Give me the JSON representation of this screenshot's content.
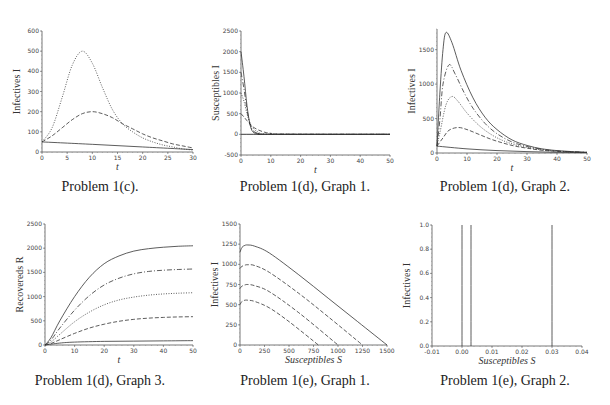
{
  "captions": [
    "Problem 1(c).",
    "Problem 1(d), Graph 1.",
    "Problem 1(d), Graph 2.",
    "Problem 1(d), Graph 3.",
    "Problem 1(e), Graph 1.",
    "Problem 1(e), Graph 2."
  ],
  "chart_data": [
    {
      "type": "line",
      "title": "Problem 1(c).",
      "xlabel": "t",
      "ylabel": "Infectives I",
      "xlim": [
        0,
        30
      ],
      "ylim": [
        0,
        600
      ],
      "xticks": [
        0,
        5,
        10,
        15,
        20,
        25,
        30
      ],
      "yticks": [
        0,
        100,
        200,
        300,
        400,
        500,
        600
      ],
      "grid": false,
      "series": [
        {
          "name": "dotted",
          "style": "dotted",
          "x": [
            0,
            2,
            4,
            6,
            8,
            10,
            12,
            14,
            16,
            18,
            20,
            22,
            24,
            26,
            28,
            30
          ],
          "values": [
            50,
            120,
            270,
            430,
            500,
            440,
            320,
            210,
            140,
            100,
            70,
            50,
            35,
            25,
            15,
            10
          ]
        },
        {
          "name": "dashed",
          "style": "dashed",
          "x": [
            0,
            2,
            4,
            6,
            8,
            10,
            12,
            14,
            16,
            18,
            20,
            22,
            24,
            26,
            28,
            30
          ],
          "values": [
            50,
            80,
            120,
            160,
            190,
            200,
            190,
            170,
            140,
            115,
            90,
            70,
            55,
            40,
            30,
            20
          ]
        },
        {
          "name": "solid",
          "style": "solid",
          "x": [
            0,
            10,
            20,
            30
          ],
          "values": [
            50,
            38,
            25,
            12
          ]
        }
      ]
    },
    {
      "type": "line",
      "title": "Problem 1(d), Graph 1.",
      "xlabel": "t",
      "ylabel": "Susceptibles I",
      "xlim": [
        0,
        50
      ],
      "ylim": [
        -500,
        2500
      ],
      "xticks": [
        0,
        10,
        20,
        30,
        40,
        50
      ],
      "yticks": [
        -500,
        0,
        500,
        1000,
        1500,
        2000,
        2500
      ],
      "grid": false,
      "series": [
        {
          "name": "S0=2000",
          "style": "solid",
          "x": [
            0,
            1,
            2,
            3,
            4,
            6,
            10,
            50
          ],
          "values": [
            2000,
            1400,
            700,
            250,
            60,
            10,
            0,
            0
          ]
        },
        {
          "name": "S0=1500",
          "style": "dashdot",
          "x": [
            0,
            1,
            2,
            3,
            4,
            6,
            10,
            50
          ],
          "values": [
            1500,
            1100,
            600,
            250,
            90,
            20,
            0,
            0
          ]
        },
        {
          "name": "S0=1000",
          "style": "dotted",
          "x": [
            0,
            1,
            2,
            3,
            4,
            6,
            10,
            50
          ],
          "values": [
            1000,
            800,
            500,
            280,
            150,
            50,
            5,
            0
          ]
        },
        {
          "name": "S0=500",
          "style": "dashed",
          "x": [
            0,
            1,
            2,
            3,
            4,
            6,
            8,
            10,
            14,
            50
          ],
          "values": [
            500,
            420,
            330,
            250,
            180,
            100,
            50,
            25,
            5,
            0
          ]
        },
        {
          "name": "S0=0",
          "style": "solid",
          "x": [
            0,
            50
          ],
          "values": [
            0,
            0
          ]
        }
      ]
    },
    {
      "type": "line",
      "title": "Problem 1(d), Graph 2.",
      "xlabel": "t",
      "ylabel": "Infectives I",
      "xlim": [
        0,
        50
      ],
      "ylim": [
        0,
        1800
      ],
      "xticks": [
        0,
        10,
        20,
        30,
        40,
        50
      ],
      "yticks": [
        0,
        500,
        1000,
        1500
      ],
      "grid": false,
      "series": [
        {
          "name": "solid-top",
          "style": "solid",
          "x": [
            0,
            1,
            2,
            3,
            5,
            8,
            12,
            16,
            20,
            25,
            30,
            35,
            40,
            45,
            50
          ],
          "values": [
            100,
            900,
            1500,
            1750,
            1600,
            1200,
            800,
            520,
            340,
            190,
            110,
            60,
            35,
            20,
            10
          ]
        },
        {
          "name": "dashdot",
          "style": "dashdot",
          "x": [
            0,
            1,
            2,
            4,
            6,
            9,
            12,
            16,
            20,
            25,
            30,
            35,
            40,
            45,
            50
          ],
          "values": [
            100,
            500,
            1000,
            1280,
            1150,
            880,
            650,
            430,
            280,
            160,
            95,
            55,
            30,
            18,
            10
          ]
        },
        {
          "name": "dotted",
          "style": "dotted",
          "x": [
            0,
            1,
            3,
            5,
            7,
            10,
            14,
            18,
            22,
            26,
            30,
            35,
            40,
            45,
            50
          ],
          "values": [
            100,
            300,
            700,
            820,
            750,
            580,
            400,
            270,
            180,
            120,
            80,
            45,
            25,
            15,
            8
          ]
        },
        {
          "name": "dashed",
          "style": "dashed",
          "x": [
            0,
            2,
            4,
            7,
            10,
            14,
            18,
            22,
            26,
            30,
            35,
            40,
            45,
            50
          ],
          "values": [
            100,
            220,
            330,
            370,
            340,
            270,
            200,
            145,
            100,
            70,
            40,
            25,
            15,
            8
          ]
        },
        {
          "name": "solid-bottom",
          "style": "solid",
          "x": [
            0,
            10,
            20,
            30,
            40,
            50
          ],
          "values": [
            100,
            60,
            35,
            20,
            10,
            5
          ]
        }
      ]
    },
    {
      "type": "line",
      "title": "Problem 1(d), Graph 3.",
      "xlabel": "t",
      "ylabel": "Recovereds R",
      "xlim": [
        0,
        50
      ],
      "ylim": [
        0,
        2500
      ],
      "xticks": [
        0,
        10,
        20,
        30,
        40,
        50
      ],
      "yticks": [
        0,
        500,
        1000,
        1500,
        2000,
        2500
      ],
      "grid": false,
      "series": [
        {
          "name": "solid-top",
          "style": "solid",
          "x": [
            0,
            2,
            5,
            10,
            15,
            20,
            25,
            30,
            35,
            40,
            45,
            50
          ],
          "values": [
            0,
            150,
            500,
            1000,
            1400,
            1680,
            1840,
            1940,
            1990,
            2020,
            2040,
            2050
          ]
        },
        {
          "name": "dashdot",
          "style": "dashdot",
          "x": [
            0,
            2,
            5,
            10,
            15,
            20,
            25,
            30,
            35,
            40,
            45,
            50
          ],
          "values": [
            0,
            100,
            350,
            720,
            1020,
            1240,
            1380,
            1470,
            1520,
            1545,
            1560,
            1570
          ]
        },
        {
          "name": "dotted",
          "style": "dotted",
          "x": [
            0,
            2,
            5,
            10,
            15,
            20,
            25,
            30,
            35,
            40,
            45,
            50
          ],
          "values": [
            0,
            60,
            220,
            480,
            680,
            830,
            930,
            990,
            1030,
            1055,
            1070,
            1080
          ]
        },
        {
          "name": "dashed",
          "style": "dashed",
          "x": [
            0,
            2,
            5,
            10,
            15,
            20,
            25,
            30,
            35,
            40,
            45,
            50
          ],
          "values": [
            0,
            30,
            110,
            240,
            350,
            430,
            490,
            530,
            555,
            570,
            580,
            585
          ]
        },
        {
          "name": "solid-bottom",
          "style": "solid",
          "x": [
            0,
            5,
            10,
            20,
            30,
            40,
            50
          ],
          "values": [
            0,
            40,
            60,
            75,
            80,
            85,
            90
          ]
        }
      ]
    },
    {
      "type": "line",
      "title": "Problem 1(e), Graph 1.",
      "xlabel": "Susceptibles S",
      "ylabel": "Infectives I",
      "xlim": [
        0,
        1500
      ],
      "ylim": [
        0,
        1500
      ],
      "xticks": [
        0,
        250,
        500,
        750,
        1000,
        1250,
        1500
      ],
      "yticks": [
        0,
        250,
        500,
        750,
        1000,
        1250,
        1500
      ],
      "grid": false,
      "series": [
        {
          "name": "S0=1500",
          "style": "solid",
          "x": [
            0,
            20,
            50,
            80,
            150,
            300,
            600,
            900,
            1200,
            1500
          ],
          "values": [
            1150,
            1210,
            1235,
            1240,
            1225,
            1140,
            870,
            580,
            290,
            0
          ]
        },
        {
          "name": "S0=1250",
          "style": "dashed",
          "x": [
            0,
            20,
            50,
            80,
            150,
            300,
            600,
            900,
            1250
          ],
          "values": [
            950,
            975,
            990,
            995,
            985,
            900,
            640,
            350,
            0
          ]
        },
        {
          "name": "S0=1000",
          "style": "dashed",
          "x": [
            0,
            20,
            50,
            80,
            150,
            300,
            600,
            1000
          ],
          "values": [
            700,
            730,
            745,
            750,
            735,
            660,
            400,
            0
          ]
        },
        {
          "name": "S0=800",
          "style": "dashed",
          "x": [
            0,
            20,
            50,
            80,
            150,
            300,
            500,
            800
          ],
          "values": [
            500,
            540,
            555,
            555,
            540,
            460,
            290,
            0
          ]
        }
      ]
    },
    {
      "type": "line",
      "title": "Problem 1(e), Graph 2.",
      "xlabel": "Susceptibles S",
      "ylabel": "Infectives I",
      "xlim": [
        -0.01,
        0.04
      ],
      "ylim": [
        0,
        1.0
      ],
      "xticks": [
        -0.01,
        0.0,
        0.01,
        0.02,
        0.03,
        0.04
      ],
      "xticklabels": [
        "-0.01",
        "0.00",
        "0.01",
        "0.02",
        "0.03",
        "0.04"
      ],
      "yticks": [
        0.0,
        0.2,
        0.4,
        0.6,
        0.8,
        1.0
      ],
      "yticklabels": [
        "0.0",
        "0.2",
        "0.4",
        "0.6",
        "0.8",
        "1.0"
      ],
      "grid": false,
      "series": [
        {
          "name": "line-a",
          "style": "solid",
          "x": [
            0.0,
            0.0
          ],
          "values": [
            0,
            1.0
          ]
        },
        {
          "name": "line-b",
          "style": "solid",
          "x": [
            0.003,
            0.003
          ],
          "values": [
            0,
            1.0
          ]
        },
        {
          "name": "line-c",
          "style": "solid",
          "x": [
            0.03,
            0.03
          ],
          "values": [
            0,
            1.0
          ]
        }
      ]
    }
  ]
}
